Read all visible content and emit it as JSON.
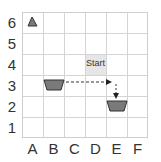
{
  "grid": {
    "columns": [
      "A",
      "B",
      "C",
      "D",
      "E",
      "F"
    ],
    "rows": [
      "6",
      "5",
      "4",
      "3",
      "2",
      "1"
    ]
  },
  "start_label": "Start",
  "start_cell": "D4",
  "pieces": [
    {
      "shape": "triangle",
      "cell": "A6"
    },
    {
      "shape": "trapezoid",
      "cell": "B3"
    },
    {
      "shape": "trapezoid",
      "cell": "E2"
    }
  ],
  "path": {
    "from": "B3",
    "via": "E3",
    "to": "E2",
    "style": "dashed-arrow"
  },
  "colors": {
    "piece_fill": "#7a7a7a",
    "piece_stroke": "#333333",
    "grid": "#d4d4d4",
    "start_bg": "#e6e6e6"
  }
}
